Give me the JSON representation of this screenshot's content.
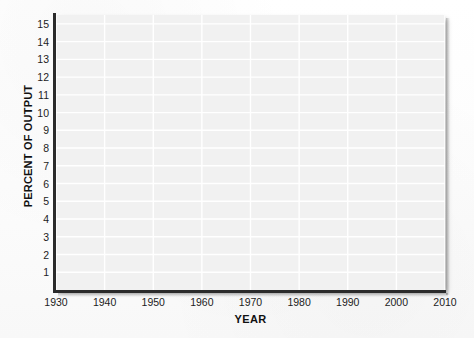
{
  "chart_data": {
    "type": "line",
    "title": "",
    "subtitle": "",
    "xlabel": "YEAR",
    "ylabel": "PERCENT OF OUTPUT",
    "xlim": [
      1930,
      2010
    ],
    "ylim": [
      0,
      15.5
    ],
    "x_tick_labels": [
      "1930",
      "1940",
      "1950",
      "1960",
      "1970",
      "1980",
      "1990",
      "2000",
      "2010"
    ],
    "x_tick_values": [
      1930,
      1940,
      1950,
      1960,
      1970,
      1980,
      1990,
      2000,
      2010
    ],
    "y_tick_labels": [
      "15",
      "14",
      "13",
      "12",
      "11",
      "10",
      "9",
      "8",
      "7",
      "6",
      "5",
      "4",
      "3",
      "2",
      "1"
    ],
    "y_tick_values": [
      15,
      14,
      13,
      12,
      11,
      10,
      9,
      8,
      7,
      6,
      5,
      4,
      3,
      2,
      1
    ],
    "grid": true,
    "grid_color": "#ffffff",
    "plot_background": "#f1f1f1",
    "axis_color": "#2b2b2b",
    "legend": [],
    "legend_position": "none",
    "annotations": [],
    "series": [],
    "note": "Blank grid with no plotted data"
  },
  "axes": {
    "y_title": "PERCENT OF OUTPUT",
    "x_title": "YEAR"
  },
  "colors": {
    "page_background": "#fdfdfd",
    "plot_fill": "#f1f1f1",
    "gridline": "#ffffff",
    "axis_line": "#2b2b2b",
    "tick_text": "#1c1c1c",
    "title_text": "#111111"
  }
}
